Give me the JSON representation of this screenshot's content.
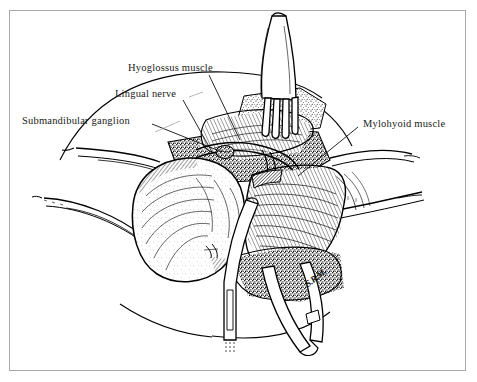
{
  "figure": {
    "kind": "anatomical-line-illustration",
    "technique": "pen-and-ink stipple and hatch drawing",
    "background_color": "#ffffff",
    "ink_color": "#000000",
    "frame_color": "#a8a8a8"
  },
  "labels": [
    {
      "id": "hyoglossus",
      "text": "Hyoglossus muscle"
    },
    {
      "id": "lingual_nerve",
      "text": "Lingual nerve"
    },
    {
      "id": "submandibular_ganglion",
      "text": "Submandibular ganglion"
    },
    {
      "id": "mylohyoid",
      "text": "Mylohyoid muscle"
    }
  ],
  "signature": {
    "text": "S.R.M."
  },
  "structures": [
    {
      "name": "rake-retractor",
      "position": "top-center"
    },
    {
      "name": "submandibular-gland",
      "position": "center-left"
    },
    {
      "name": "mylohyoid-muscle-flap",
      "position": "center-right"
    },
    {
      "name": "hyoglossus-muscle",
      "position": "upper-center"
    },
    {
      "name": "lingual-nerve",
      "position": "upper-center"
    },
    {
      "name": "submandibular-ganglion",
      "position": "upper-center-left"
    },
    {
      "name": "nerve-hook",
      "position": "bottom-center"
    },
    {
      "name": "forceps",
      "position": "bottom-center-right"
    },
    {
      "name": "skin-flap-left",
      "position": "left"
    },
    {
      "name": "skin-flap-right",
      "position": "right"
    }
  ]
}
